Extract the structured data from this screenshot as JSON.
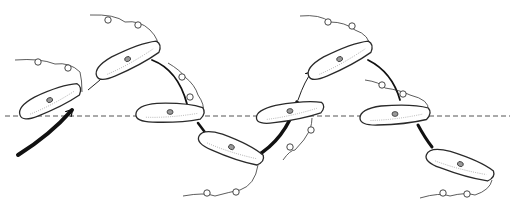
{
  "figure": {
    "width": 516,
    "height": 215,
    "colors": {
      "ink": "#2a2a2a",
      "background": "#ffffff",
      "axis": "#555555"
    },
    "reference_line": {
      "y": 116,
      "x1": 5,
      "x2": 510,
      "style": "dashed"
    },
    "cells": [
      {
        "id": 1,
        "cx": 50,
        "cy": 101,
        "rx": 33,
        "ry": 10,
        "angle": -20
      },
      {
        "id": 2,
        "cx": 128,
        "cy": 60,
        "rx": 35,
        "ry": 10,
        "angle": -22
      },
      {
        "id": 3,
        "cx": 170,
        "cy": 113,
        "rx": 34,
        "ry": 10,
        "angle": 3
      },
      {
        "id": 4,
        "cx": 231,
        "cy": 148,
        "rx": 34,
        "ry": 10,
        "angle": 25
      },
      {
        "id": 5,
        "cx": 290,
        "cy": 112,
        "rx": 34,
        "ry": 9,
        "angle": -6
      },
      {
        "id": 6,
        "cx": 340,
        "cy": 60,
        "rx": 35,
        "ry": 10,
        "angle": -22
      },
      {
        "id": 7,
        "cx": 395,
        "cy": 115,
        "rx": 35,
        "ry": 10,
        "angle": 0
      },
      {
        "id": 8,
        "cx": 460,
        "cy": 165,
        "rx": 35,
        "ry": 10,
        "angle": 22
      }
    ],
    "arrows": [
      {
        "name": "entry-arrow",
        "d": "M18 155 Q50 135 72 110",
        "width": 4
      },
      {
        "name": "arrow-1-2",
        "d": "M88 90 L100 80",
        "width": 1
      },
      {
        "name": "arrow-2-3",
        "d": "M152 60 Q178 70 187 104",
        "width": 1.8
      },
      {
        "name": "arrow-3-4",
        "d": "M198 123 L207 135",
        "width": 2.5
      },
      {
        "name": "arrow-4-5",
        "d": "M255 157 Q285 140 297 102",
        "width": 3.5
      },
      {
        "name": "arrow-5-6",
        "d": "M298 100 Q305 80 312 72",
        "width": 1
      },
      {
        "name": "arrow-6-7",
        "d": "M368 60 Q392 72 400 100",
        "width": 1.8
      },
      {
        "name": "arrow-7-8",
        "d": "M418 125 Q425 138 432 147",
        "width": 3
      }
    ],
    "flagella": [
      {
        "d": "M15 60 Q40 58 55 64 Q70 62 80 72 Q82 80 82 92",
        "loops": [
          [
            38,
            62
          ],
          [
            68,
            68
          ]
        ]
      },
      {
        "d": "M90 15 Q115 14 125 22 Q140 20 150 30 Q160 40 158 50",
        "loops": [
          [
            108,
            20
          ],
          [
            138,
            25
          ]
        ]
      },
      {
        "d": "M168 63 Q180 70 185 77 Q195 85 198 95 Q205 105 203 112",
        "loops": [
          [
            182,
            77
          ],
          [
            190,
            97
          ]
        ]
      },
      {
        "d": "M183 196 Q205 192 215 196 Q230 192 240 190 Q255 185 258 165",
        "loops": [
          [
            207,
            193
          ],
          [
            236,
            192
          ]
        ]
      },
      {
        "d": "M283 160 Q290 150 295 150 Q305 140 310 130 Q312 123 312 118",
        "loops": [
          [
            290,
            147
          ],
          [
            311,
            130
          ]
        ]
      },
      {
        "d": "M300 16 Q320 14 330 22 Q345 22 355 30 Q370 35 370 48",
        "loops": [
          [
            328,
            22
          ],
          [
            352,
            26
          ]
        ]
      },
      {
        "d": "M365 80 Q380 82 385 88 Q400 90 410 95 Q430 100 428 110",
        "loops": [
          [
            382,
            85
          ],
          [
            403,
            94
          ]
        ]
      },
      {
        "d": "M420 198 Q440 192 450 196 Q465 192 475 195 Q490 190 492 180",
        "loops": [
          [
            443,
            193
          ],
          [
            467,
            194
          ]
        ]
      }
    ]
  }
}
